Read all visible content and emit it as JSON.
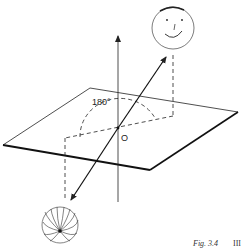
{
  "figure": {
    "angle_label": "180°",
    "origin_label": "O",
    "caption": "Fig. 3.4",
    "page_marker": "III"
  },
  "elements": {
    "plane": "parallelogram-plane",
    "vertical_axis": "vertical-axis-arrow",
    "rotation_axis": "double-headed-arrow-through-origin",
    "top_object": "smiley-face-sphere",
    "bottom_object": "sphere-with-radiating-meridians",
    "arc": "dashed-180-degree-arc",
    "projections": "dashed-projection-lines"
  },
  "colors": {
    "ink": "#222222",
    "background": "#ffffff"
  }
}
